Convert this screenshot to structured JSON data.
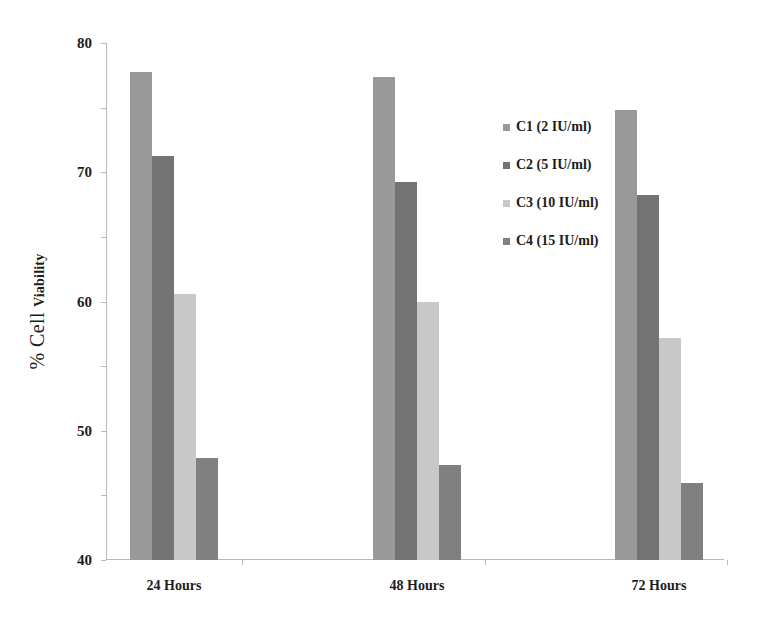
{
  "chart_data": {
    "type": "bar",
    "title": "",
    "xlabel": "",
    "ylabel": "% Cell Viability",
    "ylabel_main": "% Cell",
    "ylabel_sub": "Viability",
    "categories": [
      "24 Hours",
      "48 Hours",
      "72 Hours"
    ],
    "series": [
      {
        "name": "C1 (2 IU/ml)",
        "color": "#999999",
        "values": [
          75.5,
          74.8,
          69.7
        ]
      },
      {
        "name": "C2 (5 IU/ml)",
        "color": "#737373",
        "values": [
          62.5,
          58.5,
          56.5
        ]
      },
      {
        "name": "C3 (10 IU/ml)",
        "color": "#c8c8c8",
        "values": [
          41.2,
          39.9,
          34.3
        ]
      },
      {
        "name": "C4 (15 IU/ml)",
        "color": "#808080",
        "values": [
          15.8,
          14.7,
          11.9
        ]
      }
    ],
    "ylim": [
      0,
      80
    ],
    "yticks": [
      0,
      10,
      20,
      30,
      40,
      50,
      60,
      70,
      80
    ],
    "ytick_labels": [
      "0",
      "10",
      "20",
      "30",
      "40",
      "50",
      "60",
      "70",
      "80"
    ],
    "grid": false,
    "legend_position": "upper-right",
    "axis_color": "#b9b9b9",
    "text_color": "#1c1c1c"
  }
}
